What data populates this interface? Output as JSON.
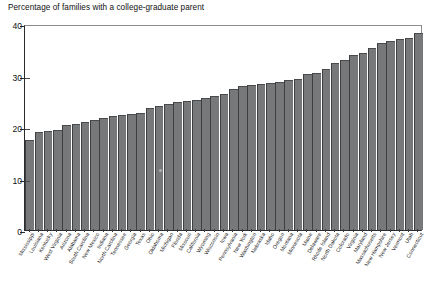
{
  "chart_data": {
    "type": "bar",
    "title": "Percentage of families with a college-graduate parent",
    "xlabel": "",
    "ylabel": "",
    "ylim": [
      0,
      40
    ],
    "yticks": [
      0,
      10,
      20,
      30,
      40
    ],
    "grid": false,
    "legend": null,
    "bar_color": "#77787a",
    "categories": [
      "Mississippi",
      "Louisiana",
      "Kentucky",
      "West Virginia",
      "Arizona",
      "Alabama",
      "South Carolina",
      "New Mexico",
      "Indiana",
      "North Carolina",
      "Tennessee",
      "Georgia",
      "Texas",
      "Ohio",
      "Oklahoma",
      "Michigan",
      "Florida",
      "Missouri",
      "California",
      "Wyoming",
      "Wisconsin",
      "Iowa",
      "Pennsylvania",
      "New York",
      "Washington",
      "Nebraska",
      "Idaho",
      "Oregon",
      "Montana",
      "Minnesota",
      "Maine",
      "Delaware",
      "Rhode Island",
      "North Dakota",
      "Colorado",
      "Virginia",
      "Maryland",
      "Massachusetts",
      "New Hampshire",
      "New Jersey",
      "Vermont",
      "Utah",
      "Connecticut"
    ],
    "values": [
      17.5,
      19.0,
      19.3,
      19.5,
      20.3,
      20.6,
      21.0,
      21.3,
      21.8,
      22.2,
      22.4,
      22.6,
      22.8,
      23.6,
      24.1,
      24.4,
      24.8,
      25.0,
      25.3,
      25.6,
      26.0,
      26.4,
      27.4,
      28.0,
      28.2,
      28.4,
      28.6,
      28.8,
      29.2,
      29.4,
      30.2,
      30.5,
      31.2,
      32.4,
      33.1,
      34.0,
      34.4,
      35.3,
      36.4,
      36.7,
      37.0,
      37.2,
      38.2
    ]
  }
}
